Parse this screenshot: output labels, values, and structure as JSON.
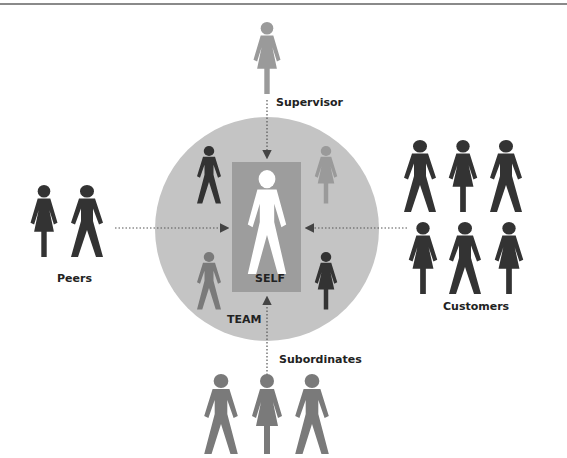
{
  "diagram": {
    "colors": {
      "circle": "#c4c4c4",
      "self_box": "#9d9d9d",
      "dark_figure": "#333333",
      "mid_figure": "#7a7a7a",
      "light_figure": "#9a9a9a",
      "self_figure": "#ffffff",
      "arrow": "#444444"
    },
    "labels": {
      "supervisor": "Supervisor",
      "peers": "Peers",
      "customers": "Customers",
      "subordinates": "Subordinates",
      "self": "SELF",
      "team": "TEAM"
    },
    "groups": [
      {
        "name": "Supervisor",
        "figures": [
          "female"
        ]
      },
      {
        "name": "Peers",
        "figures": [
          "female",
          "male"
        ]
      },
      {
        "name": "Customers",
        "figures": [
          "male",
          "female",
          "male",
          "female",
          "male",
          "female"
        ]
      },
      {
        "name": "Subordinates",
        "figures": [
          "male",
          "female",
          "male"
        ]
      },
      {
        "name": "Team",
        "figures": [
          "male",
          "female",
          "male",
          "female"
        ]
      }
    ]
  }
}
